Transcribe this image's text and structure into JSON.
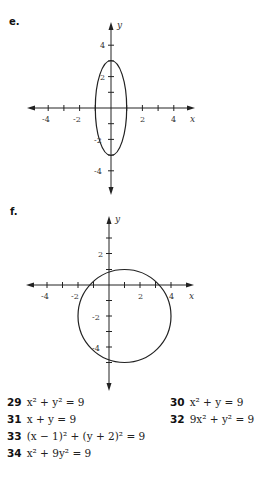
{
  "graphs": [
    {
      "label": "e.",
      "x_axis_label": "x",
      "y_axis_label": "y",
      "x_tick_labels": [
        "-4",
        "-2",
        "2",
        "4"
      ],
      "y_tick_labels": [
        "4",
        "2",
        "-2",
        "-4"
      ],
      "curve": "ellipse",
      "center": [
        0,
        0
      ],
      "semi_axes": [
        1,
        3
      ]
    },
    {
      "label": "f.",
      "x_axis_label": "x",
      "y_axis_label": "y",
      "x_tick_labels": [
        "-4",
        "-2",
        "2",
        "4"
      ],
      "y_tick_labels": [
        "2",
        "-2",
        "-4"
      ],
      "curve": "circle",
      "center": [
        1,
        -2
      ],
      "radius": 3
    }
  ],
  "problems": [
    {
      "number": "29",
      "equation": "x² + y² = 9"
    },
    {
      "number": "30",
      "equation": "x² + y = 9"
    },
    {
      "number": "31",
      "equation": "x + y = 9"
    },
    {
      "number": "32",
      "equation": "9x² + y² = 9"
    },
    {
      "number": "33",
      "equation": "(x − 1)² + (y + 2)² = 9"
    },
    {
      "number": "34",
      "equation": "x² + 9y² = 9"
    }
  ]
}
